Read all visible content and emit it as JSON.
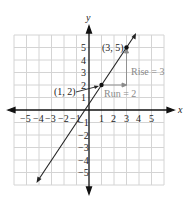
{
  "figure": {
    "axes": {
      "x_label": "x",
      "y_label": "y"
    },
    "x_ticks": [
      "−5",
      "−4",
      "−3",
      "−2",
      "−1",
      "1",
      "2",
      "3",
      "4",
      "5"
    ],
    "y_ticks": [
      "5",
      "4",
      "3",
      "2",
      "1",
      "−1",
      "−2",
      "−3",
      "−4",
      "−5"
    ],
    "points": [
      {
        "label": "(1, 2)",
        "x": 1,
        "y": 2
      },
      {
        "label": "(3, 5)",
        "x": 3,
        "y": 5
      }
    ],
    "annotations": {
      "run": "Run = 2",
      "rise": "Rise = 3"
    },
    "line": {
      "slope": 1.5,
      "intercept": 0.5
    },
    "colors": {
      "grid": "#d0d0d0",
      "axis": "#111111",
      "annotation": "#8a8a8a"
    }
  }
}
